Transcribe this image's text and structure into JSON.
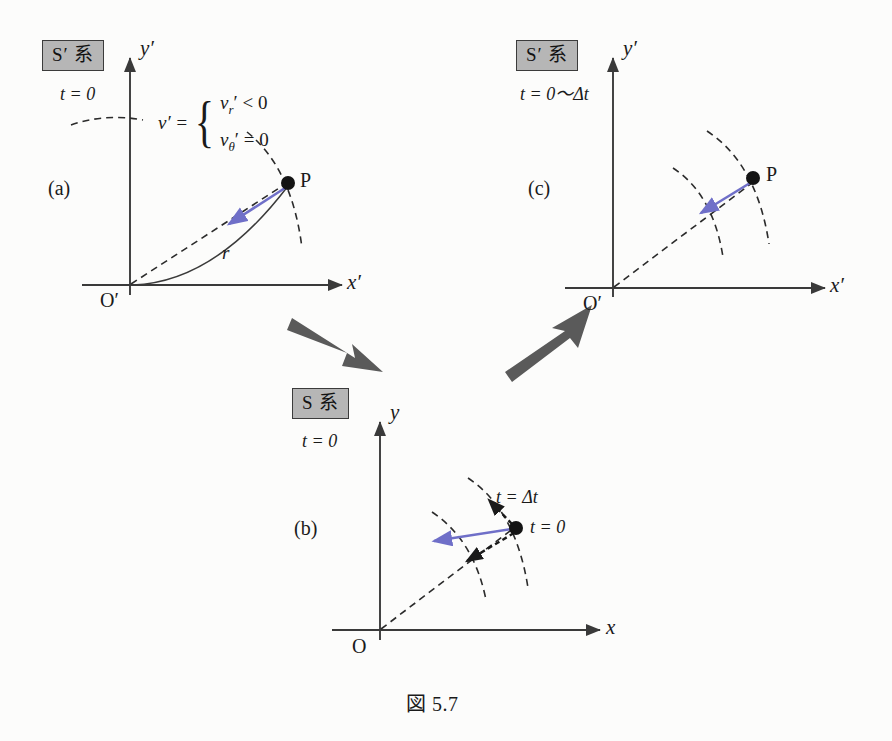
{
  "figure": {
    "caption": "図 5.7",
    "background_color": "#fcfcfb",
    "ink_color": "#1a1a1a",
    "velocity_arrow_color": "#6f6fc8",
    "transition_arrow_color": "#5a5a5a",
    "sysbox_fill": "#b6b6b6"
  },
  "panels": {
    "a": {
      "letter": "(a)",
      "frame_label": "S′ 系",
      "time_label": "t = 0",
      "x_axis_label": "x′",
      "y_axis_label": "y′",
      "origin_label": "O′",
      "point_label": "P",
      "radius_label": "r",
      "formula": {
        "lhs": "v′ =",
        "rows": [
          {
            "symbol": "v",
            "sub": "r",
            "prime": "′",
            "relation": "< 0"
          },
          {
            "symbol": "v",
            "sub": "θ",
            "prime": "′",
            "relation": "= 0"
          }
        ],
        "row1_text": "v r ′ < 0",
        "row2_text": "v θ ′ = 0"
      }
    },
    "b": {
      "letter": "(b)",
      "frame_label": "S 系",
      "time_label": "t = 0",
      "x_axis_label": "x",
      "y_axis_label": "y",
      "origin_label": "O",
      "point_time_label": "t = 0",
      "arc_time_label": "t = Δt"
    },
    "c": {
      "letter": "(c)",
      "frame_label": "S′ 系",
      "time_label": "t = 0～Δt",
      "x_axis_label": "x′",
      "y_axis_label": "y′",
      "origin_label": "O′",
      "point_label": "P"
    }
  },
  "transitions": [
    {
      "name": "a-to-b",
      "direction": "down-right"
    },
    {
      "name": "b-to-c",
      "direction": "up-right"
    }
  ]
}
